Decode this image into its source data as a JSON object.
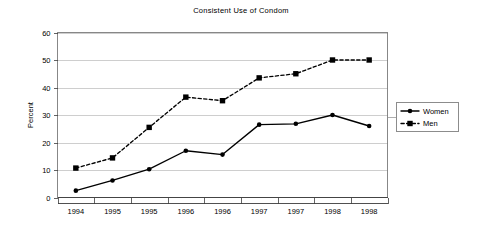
{
  "chart_data": {
    "type": "line",
    "title": "Consistent Use of Condom",
    "xlabel": "",
    "ylabel": "Percent",
    "categories": [
      "1994",
      "1995",
      "1995",
      "1996",
      "1996",
      "1997",
      "1997",
      "1998",
      "1998"
    ],
    "ylim": [
      0,
      60
    ],
    "yticks": [
      0,
      10,
      20,
      30,
      40,
      50,
      60
    ],
    "ytick_labels": [
      "0",
      "10",
      "20",
      "30",
      "40",
      "50",
      "60"
    ],
    "grid": "horizontal",
    "legend_position": "right",
    "series": [
      {
        "name": "Women",
        "marker": "circle",
        "line_style": "solid",
        "color": "#000000",
        "values": [
          2.5,
          6.2,
          10.3,
          17.0,
          15.6,
          26.5,
          26.8,
          30.0,
          26.0
        ]
      },
      {
        "name": "Men",
        "marker": "square",
        "line_style": "dashed",
        "color": "#000000",
        "values": [
          10.7,
          14.4,
          25.5,
          36.5,
          35.2,
          43.5,
          45.0,
          50.0,
          50.0
        ]
      }
    ]
  },
  "legend": {
    "items": [
      {
        "label": "Women"
      },
      {
        "label": "Men"
      }
    ]
  }
}
